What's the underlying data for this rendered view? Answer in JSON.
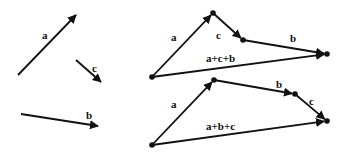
{
  "diagram": {
    "colors": {
      "stroke": "#111111",
      "background": "#ffffff"
    },
    "free_vectors": [
      {
        "name": "a",
        "label": "a",
        "from": [
          18,
          75
        ],
        "to": [
          76,
          15
        ],
        "label_pos": [
          42,
          30
        ]
      },
      {
        "name": "c",
        "label": "c",
        "from": [
          76,
          60
        ],
        "to": [
          101,
          82
        ],
        "label_pos": [
          92,
          63
        ]
      },
      {
        "name": "b",
        "label": "b",
        "from": [
          21,
          114
        ],
        "to": [
          98,
          126
        ],
        "label_pos": [
          86,
          110
        ]
      }
    ],
    "sum_top": {
      "order": "a+c+b",
      "points": {
        "start": [
          152,
          77
        ],
        "after_a": [
          213,
          13
        ],
        "after_c": [
          243,
          40
        ],
        "after_b": [
          327,
          54
        ]
      },
      "labels": [
        {
          "text": "a",
          "pos": [
            171,
            32
          ]
        },
        {
          "text": "c",
          "pos": [
            216,
            30
          ]
        },
        {
          "text": "b",
          "pos": [
            290,
            33
          ]
        },
        {
          "text": "a+c+b",
          "pos": [
            206,
            53
          ]
        }
      ]
    },
    "sum_bottom": {
      "order": "a+b+c",
      "points": {
        "start": [
          152,
          145
        ],
        "after_a": [
          214,
          80
        ],
        "after_b": [
          295,
          94
        ],
        "after_c": [
          327,
          121
        ]
      },
      "labels": [
        {
          "text": "a",
          "pos": [
            171,
            99
          ]
        },
        {
          "text": "b",
          "pos": [
            276,
            79
          ]
        },
        {
          "text": "c",
          "pos": [
            309,
            96
          ]
        },
        {
          "text": "a+b+c",
          "pos": [
            206,
            121
          ]
        }
      ]
    }
  }
}
